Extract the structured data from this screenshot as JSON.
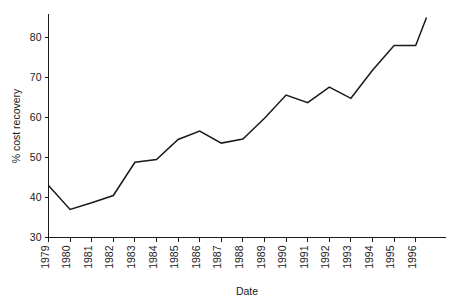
{
  "chart_data": {
    "type": "line",
    "title": "",
    "xlabel": "Date",
    "ylabel": "% cost recovery",
    "xlim": [
      1979,
      1996.5
    ],
    "ylim": [
      30,
      85
    ],
    "grid": false,
    "legend": "none",
    "x_tick_labels": [
      "1979",
      "1980",
      "1981",
      "1982",
      "1983",
      "1984",
      "1985",
      "1986",
      "1987",
      "1988",
      "1989",
      "1990",
      "1991",
      "1992",
      "1993",
      "1994",
      "1995",
      "1996"
    ],
    "y_tick_labels": [
      "30",
      "40",
      "50",
      "60",
      "70",
      "80"
    ],
    "y_ticks": [
      30,
      40,
      50,
      60,
      70,
      80
    ],
    "x": [
      1979,
      1980,
      1981,
      1982,
      1983,
      1984,
      1985,
      1986,
      1987,
      1988,
      1989,
      1990,
      1991,
      1992,
      1993,
      1994,
      1995,
      1996,
      1996.5
    ],
    "values": [
      43.0,
      37.0,
      38.7,
      40.5,
      48.8,
      49.5,
      54.5,
      56.6,
      53.6,
      54.6,
      59.8,
      65.6,
      63.7,
      67.6,
      64.8,
      71.8,
      78.0,
      78.0,
      85.0
    ],
    "series": [
      {
        "name": "% cost recovery",
        "values": [
          43.0,
          37.0,
          38.7,
          40.5,
          48.8,
          49.5,
          54.5,
          56.6,
          53.6,
          54.6,
          59.8,
          65.6,
          63.7,
          67.6,
          64.8,
          71.8,
          78.0,
          78.0,
          85.0
        ]
      }
    ],
    "line_color": "#1a1a1a"
  }
}
